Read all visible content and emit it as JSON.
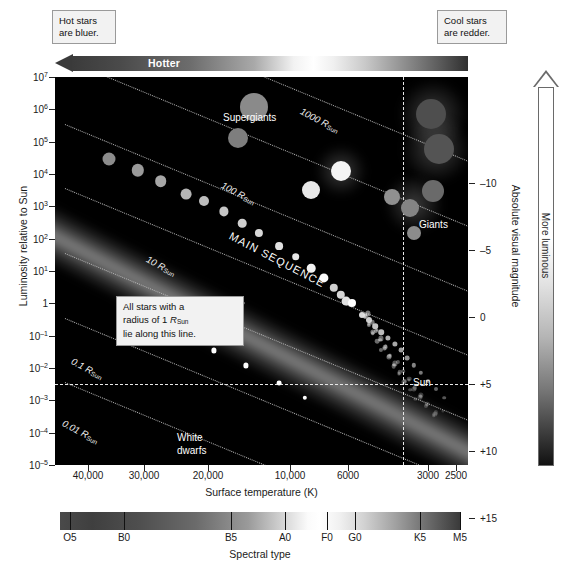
{
  "callouts": {
    "hot_stars": "Hot stars\nare bluer.",
    "cool_stars": "Cool stars\nare redder.",
    "hotter_arrow": "Hotter",
    "rsun_note_line1": "All stars with a",
    "rsun_note_line2a": "radius of 1 ",
    "rsun_note_line2b": "R",
    "rsun_note_line2c": "Sun",
    "rsun_note_line3": "lie along this line.",
    "hr_note": "H-R diagrams are sometimes plotted with either spectral type or temperature."
  },
  "axes": {
    "y_title": "Luminosity relative to Sun",
    "x_title": "Surface temperature (K)",
    "right_title": "Absolute visual magnitude",
    "more_luminous": "More luminous",
    "spectral_title": "Spectral type",
    "y_ticks": [
      {
        "label_base": "10",
        "exp": "7",
        "value": 7
      },
      {
        "label_base": "10",
        "exp": "6",
        "value": 6
      },
      {
        "label_base": "10",
        "exp": "5",
        "value": 5
      },
      {
        "label_base": "10",
        "exp": "4",
        "value": 4
      },
      {
        "label_base": "10",
        "exp": "3",
        "value": 3
      },
      {
        "label_base": "10",
        "exp": "2",
        "value": 2
      },
      {
        "label_base": "10",
        "exp": "1",
        "value": 1
      },
      {
        "label_base": "1",
        "exp": "",
        "value": 0
      },
      {
        "label_base": "10",
        "exp": "–1",
        "value": -1
      },
      {
        "label_base": "10",
        "exp": "–2",
        "value": -2
      },
      {
        "label_base": "10",
        "exp": "–3",
        "value": -3
      },
      {
        "label_base": "10",
        "exp": "–4",
        "value": -4
      },
      {
        "label_base": "10",
        "exp": "–5",
        "value": -5
      }
    ],
    "x_ticks": [
      {
        "label": "40,000",
        "x": 88
      },
      {
        "label": "30,000",
        "x": 144
      },
      {
        "label": "20,000",
        "x": 208
      },
      {
        "label": "10,000",
        "x": 290
      },
      {
        "label": "6000",
        "x": 348
      },
      {
        "label": "3000",
        "x": 428
      },
      {
        "label": "2500",
        "x": 456
      }
    ],
    "right_ticks": [
      {
        "label": "–10",
        "y": 106
      },
      {
        "label": "–5",
        "y": 173
      },
      {
        "label": "0",
        "y": 240
      },
      {
        "label": "+5",
        "y": 307
      },
      {
        "label": "+10",
        "y": 374
      },
      {
        "label": "+15",
        "y": 441
      }
    ],
    "spectral_ticks": [
      {
        "label": "O5",
        "x": 70
      },
      {
        "label": "B0",
        "x": 124
      },
      {
        "label": "B5",
        "x": 231
      },
      {
        "label": "A0",
        "x": 285
      },
      {
        "label": "F0",
        "x": 327
      },
      {
        "label": "G0",
        "x": 355
      },
      {
        "label": "K5",
        "x": 420
      },
      {
        "label": "M5",
        "x": 460
      }
    ]
  },
  "plot_labels": {
    "supergiants": "Supergiants",
    "giants": "Giants",
    "main_sequence": "MAIN SEQUENCE",
    "sun": "Sun",
    "white_dwarfs_line1": "White",
    "white_dwarfs_line2": "dwarfs",
    "radius_lines": [
      {
        "label": "1000",
        "unit": "R",
        "sub": "Sun",
        "x": 246,
        "y": 28
      },
      {
        "label": "100",
        "unit": "R",
        "sub": "Sun",
        "x": 167,
        "y": 102
      },
      {
        "label": "10",
        "unit": "R",
        "sub": "Sun",
        "x": 92,
        "y": 176
      },
      {
        "label": "1",
        "unit": "R",
        "sub": "Sun",
        "x": 63,
        "y": 226
      },
      {
        "label": "0.1",
        "unit": "R",
        "sub": "Sun",
        "x": 17,
        "y": 278
      },
      {
        "label": "0.01",
        "unit": "R",
        "sub": "Sun",
        "x": 8,
        "y": 340
      },
      {
        "label": "0.001",
        "unit": "R",
        "sub": "Sun",
        "x": 1,
        "y": 394
      }
    ]
  },
  "chart_data": {
    "type": "scatter",
    "xlabel": "Surface temperature (K)",
    "ylabel": "Luminosity relative to Sun",
    "xlim": [
      45000,
      2300
    ],
    "ylim": [
      1e-05,
      10000000.0
    ],
    "x_scale": "log-reversed",
    "y_scale": "log",
    "grid": false,
    "legend": null,
    "annotations": [
      "Supergiants",
      "Giants",
      "MAIN SEQUENCE",
      "White dwarfs",
      "Sun"
    ],
    "radius_isolines_rsun": [
      1000,
      100,
      10,
      1,
      0.1,
      0.01,
      0.001
    ],
    "series": [
      {
        "name": "Main sequence stars",
        "points": [
          {
            "x": 36000,
            "y": 30000,
            "r": 6.5,
            "shade": "#8c8c8c"
          },
          {
            "x": 31000,
            "y": 13000,
            "r": 6.2,
            "shade": "#9a9a9a"
          },
          {
            "x": 27000,
            "y": 6000,
            "r": 5.8,
            "shade": "#a6a6a6"
          },
          {
            "x": 23000,
            "y": 2400,
            "r": 5.4,
            "shade": "#b4b4b4"
          },
          {
            "x": 20500,
            "y": 1500,
            "r": 5.0,
            "shade": "#bdbdbd"
          },
          {
            "x": 17500,
            "y": 700,
            "r": 4.6,
            "shade": "#c6c6c6"
          },
          {
            "x": 15000,
            "y": 300,
            "r": 4.3,
            "shade": "#cfcfcf"
          },
          {
            "x": 13000,
            "y": 150,
            "r": 4.1,
            "shade": "#d8d8d8"
          },
          {
            "x": 11000,
            "y": 60,
            "r": 3.9,
            "shade": "#e0e0e0"
          },
          {
            "x": 9500,
            "y": 28,
            "r": 3.8,
            "shade": "#e8e8e8"
          },
          {
            "x": 8300,
            "y": 12,
            "r": 4.3,
            "shade": "#f2f2f2"
          },
          {
            "x": 7400,
            "y": 6,
            "r": 4.6,
            "shade": "#fafafa"
          },
          {
            "x": 6800,
            "y": 3,
            "r": 4.2,
            "shade": "#cfcfcf"
          },
          {
            "x": 6400,
            "y": 1.8,
            "r": 4.2,
            "shade": "#d5d5d5"
          },
          {
            "x": 6100,
            "y": 1.2,
            "r": 4.4,
            "shade": "#e2e2e2"
          },
          {
            "x": 5800,
            "y": 1.0,
            "r": 4.0,
            "shade": "#ffffff",
            "label": "Sun"
          },
          {
            "x": 5300,
            "y": 0.45,
            "r": 3.0,
            "shade": "#d8d8d8"
          },
          {
            "x": 5000,
            "y": 0.3,
            "r": 3.0,
            "shade": "#cccccc"
          },
          {
            "x": 4750,
            "y": 0.2,
            "r": 2.8,
            "shade": "#c4c4c4"
          },
          {
            "x": 4500,
            "y": 0.13,
            "r": 2.8,
            "shade": "#bcbcbc"
          },
          {
            "x": 4250,
            "y": 0.085,
            "r": 2.6,
            "shade": "#b0b0b0"
          },
          {
            "x": 4000,
            "y": 0.055,
            "r": 2.6,
            "shade": "#a8a8a8"
          },
          {
            "x": 3800,
            "y": 0.035,
            "r": 2.4,
            "shade": "#9c9c9c"
          },
          {
            "x": 3600,
            "y": 0.02,
            "r": 2.4,
            "shade": "#909090"
          },
          {
            "x": 3400,
            "y": 0.012,
            "r": 2.2,
            "shade": "#848484"
          },
          {
            "x": 3200,
            "y": 0.007,
            "r": 2.2,
            "shade": "#787878"
          },
          {
            "x": 3000,
            "y": 0.004,
            "r": 2.0,
            "shade": "#6c6c6c"
          },
          {
            "x": 2850,
            "y": 0.0022,
            "r": 2.0,
            "shade": "#606060"
          },
          {
            "x": 2700,
            "y": 0.0012,
            "r": 1.8,
            "shade": "#565656"
          }
        ]
      },
      {
        "name": "Supergiants",
        "points": [
          {
            "x": 13500,
            "y": 1200000,
            "r": 14,
            "shade": "#8a8a8a"
          },
          {
            "x": 15500,
            "y": 130000,
            "r": 10,
            "shade": "#7e7e7e"
          },
          {
            "x": 2950,
            "y": 700000,
            "r": 15,
            "shade": "#4e4e4e"
          },
          {
            "x": 2800,
            "y": 60000,
            "r": 15,
            "shade": "#545454"
          }
        ]
      },
      {
        "name": "Giants",
        "points": [
          {
            "x": 8300,
            "y": 3200,
            "r": 9,
            "shade": "#e8e8e8"
          },
          {
            "x": 6400,
            "y": 12000,
            "r": 10,
            "shade": "#f4f4f4"
          },
          {
            "x": 4100,
            "y": 2000,
            "r": 8,
            "shade": "#909090"
          },
          {
            "x": 3500,
            "y": 900,
            "r": 9,
            "shade": "#848484"
          },
          {
            "x": 2900,
            "y": 3000,
            "r": 11,
            "shade": "#6a6a6a"
          },
          {
            "x": 3400,
            "y": 150,
            "r": 7,
            "shade": "#8c8c8c"
          }
        ]
      },
      {
        "name": "White dwarfs",
        "points": [
          {
            "x": 23000,
            "y": 0.09,
            "r": 2.6,
            "shade": "#ffffff"
          },
          {
            "x": 19000,
            "y": 0.035,
            "r": 2.6,
            "shade": "#ffffff"
          },
          {
            "x": 14500,
            "y": 0.012,
            "r": 2.6,
            "shade": "#ffffff"
          },
          {
            "x": 11000,
            "y": 0.0035,
            "r": 2.4,
            "shade": "#ffffff"
          },
          {
            "x": 8800,
            "y": 0.0012,
            "r": 2.2,
            "shade": "#ffffff"
          }
        ]
      }
    ]
  }
}
